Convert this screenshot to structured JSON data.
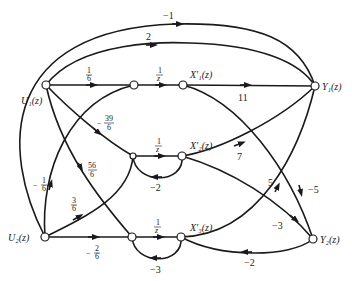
{
  "diagram": {
    "type": "signal-flow-graph",
    "nodes": {
      "u1": {
        "label": "U₁(z)"
      },
      "u2": {
        "label": "U₂(z)"
      },
      "x1": {
        "label": "X′₁(z)"
      },
      "x2": {
        "label": "X′₂(z)"
      },
      "x3": {
        "label": "X′₃(z)"
      },
      "y1": {
        "label": "Y₁(z)"
      },
      "y2": {
        "label": "Y₂(z)"
      }
    },
    "gains": {
      "u1_y1_outer": "−1",
      "u1_y1_inner": "2",
      "u1_a_num": "1",
      "u1_a_den": "6",
      "a_x1_num": "1",
      "a_x1_den": "z",
      "u1_b_sign": "−",
      "u1_b_num": "39",
      "u1_b_den": "6",
      "u1_c_num": "56",
      "u1_c_den": "6",
      "b_x2_num": "1",
      "b_x2_den": "z",
      "c_x3_num": "1",
      "c_x3_den": "z",
      "x2_loop": "−2",
      "x3_loop": "−3",
      "x1_y1": "11",
      "x2_y1": "7",
      "x1_y2": "−5",
      "x3_y1": "5",
      "x2_y2": "−3",
      "y2_x3": "−2",
      "u2_a_sign": "−",
      "u2_a_num": "1",
      "u2_a_den": "6",
      "u2_b_num": "3",
      "u2_b_den": "6",
      "u2_c_sign": "−",
      "u2_c_num": "2",
      "u2_c_den": "6"
    }
  }
}
